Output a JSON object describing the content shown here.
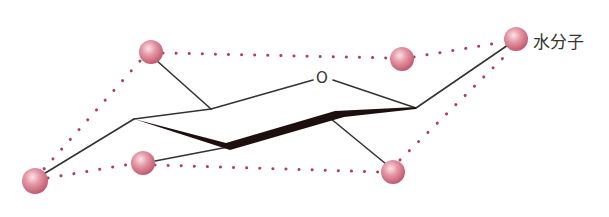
{
  "diagram": {
    "ring_oxygen_label": "O",
    "water_label": "水分子",
    "colors": {
      "ball": "#d9778a",
      "ball_highlight": "#fbe3e8",
      "dots": "#b0405a",
      "bond": "#333333",
      "wedge": "#1e0f0f"
    }
  }
}
